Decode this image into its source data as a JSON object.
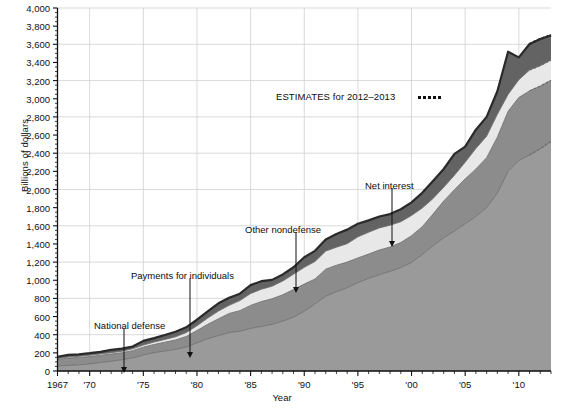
{
  "chart_data": {
    "type": "area",
    "stacked": true,
    "title": "",
    "xlabel": "Year",
    "ylabel": "Billions of dollars",
    "xlim": [
      1967,
      2013
    ],
    "ylim": [
      0,
      4000
    ],
    "ytick_step": 200,
    "gridlines": "every 400 on y, every 5 years on x",
    "legend_position": "inline annotations with arrows",
    "x": [
      1967,
      1968,
      1969,
      1970,
      1971,
      1972,
      1973,
      1974,
      1975,
      1976,
      1977,
      1978,
      1979,
      1980,
      1981,
      1982,
      1983,
      1984,
      1985,
      1986,
      1987,
      1988,
      1989,
      1990,
      1991,
      1992,
      1993,
      1994,
      1995,
      1996,
      1997,
      1998,
      1999,
      2000,
      2001,
      2002,
      2003,
      2004,
      2005,
      2006,
      2007,
      2008,
      2009,
      2010,
      2011,
      2012,
      2013
    ],
    "ytick_labels": [
      "0",
      "200",
      "400",
      "600",
      "800",
      "1,000",
      "1,200",
      "1,400",
      "1,600",
      "1,800",
      "2,000",
      "2,200",
      "2,400",
      "2,600",
      "2,800",
      "3,000",
      "3,200",
      "3,400",
      "3,600",
      "3,800",
      "4,000"
    ],
    "xtick_labels": [
      "1967",
      "'70",
      "'75",
      "'80",
      "'85",
      "'90",
      "'95",
      "'00",
      "'05",
      "'10"
    ],
    "xtick_years": [
      1967,
      1970,
      1975,
      1980,
      1985,
      1990,
      1995,
      2000,
      2005,
      2010
    ],
    "series": [
      {
        "name": "Payments for individuals",
        "color": "#9a9a9a",
        "values": [
          55,
          62,
          68,
          78,
          94,
          108,
          124,
          144,
          176,
          202,
          220,
          238,
          264,
          312,
          356,
          390,
          424,
          438,
          470,
          492,
          514,
          550,
          594,
          658,
          740,
          824,
          874,
          918,
          974,
          1022,
          1062,
          1098,
          1140,
          1196,
          1284,
          1380,
          1468,
          1542,
          1622,
          1704,
          1800,
          1960,
          2200,
          2320,
          2380,
          2450,
          2530
        ]
      },
      {
        "name": "National defense",
        "color": "#8c8c8c",
        "values": [
          70,
          81,
          82,
          81,
          79,
          79,
          77,
          80,
          87,
          90,
          97,
          104,
          116,
          134,
          158,
          185,
          210,
          227,
          253,
          273,
          282,
          290,
          304,
          300,
          273,
          298,
          291,
          282,
          272,
          266,
          271,
          268,
          275,
          295,
          306,
          349,
          405,
          456,
          495,
          522,
          551,
          616,
          661,
          694,
          706,
          690,
          673
        ]
      },
      {
        "name": "Net interest",
        "color": "#e8e8e8",
        "values": [
          10,
          11,
          12,
          14,
          15,
          15,
          17,
          21,
          23,
          27,
          30,
          35,
          43,
          53,
          69,
          85,
          90,
          111,
          130,
          136,
          139,
          152,
          169,
          184,
          194,
          199,
          199,
          203,
          232,
          241,
          244,
          241,
          230,
          223,
          206,
          171,
          153,
          160,
          184,
          227,
          237,
          253,
          187,
          196,
          230,
          225,
          223
        ]
      },
      {
        "name": "Other nondefense",
        "color": "#636363",
        "values": [
          22,
          24,
          22,
          23,
          23,
          30,
          28,
          24,
          46,
          43,
          49,
          56,
          58,
          66,
          74,
          86,
          84,
          76,
          93,
          89,
          69,
          72,
          76,
          111,
          117,
          128,
          145,
          155,
          144,
          131,
          125,
          122,
          137,
          145,
          167,
          193,
          200,
          234,
          171,
          206,
          212,
          254,
          470,
          246,
          287,
          294,
          274
        ]
      }
    ],
    "annotations": [
      {
        "id": "national-defense",
        "text": "National defense",
        "year": 1973,
        "label_x": 94,
        "label_y": 320,
        "arrow_from_x": 124,
        "arrow_from_y": 328,
        "arrow_to_x": 124,
        "arrow_to_y": 373
      },
      {
        "id": "payments-for-individuals",
        "text": "Payments for individuals",
        "year": 1979,
        "label_x": 131,
        "label_y": 270,
        "arrow_from_x": 190,
        "arrow_from_y": 278,
        "arrow_to_x": 190,
        "arrow_to_y": 358
      },
      {
        "id": "other-nondefense",
        "text": "Other nondefense",
        "year": 1988,
        "label_x": 245,
        "label_y": 224,
        "arrow_from_x": 296,
        "arrow_from_y": 232,
        "arrow_to_x": 296,
        "arrow_to_y": 293
      },
      {
        "id": "net-interest",
        "text": "Net interest",
        "year": 1997,
        "label_x": 365,
        "label_y": 180,
        "arrow_from_x": 392,
        "arrow_from_y": 188,
        "arrow_to_x": 392,
        "arrow_to_y": 247
      }
    ],
    "estimates_note": {
      "text": "ESTIMATES for 2012–2013",
      "marker": "dotted-line",
      "dot_count": 5,
      "years": [
        2012,
        2013
      ]
    }
  }
}
